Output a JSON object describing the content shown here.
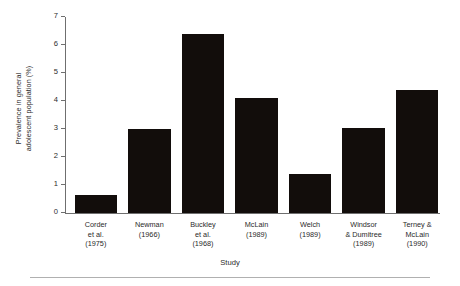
{
  "chart_data": {
    "type": "bar",
    "title": "",
    "xlabel": "Study",
    "ylabel": "Prevalence in general adolescent population (%)",
    "ylabel_lines": [
      "Prevalence in general",
      "adolescent population (%)"
    ],
    "categories": [
      "Corder et al. (1975)",
      "Newman (1966)",
      "Buckley et al. (1968)",
      "McLain (1989)",
      "Welch (1989)",
      "Windsor & Dumitree (1989)",
      "Terney & McLain (1990)"
    ],
    "category_lines": [
      [
        "Corder",
        "et al.",
        "(1975)"
      ],
      [
        "Newman",
        "(1966)"
      ],
      [
        "Buckley",
        "et al.",
        "(1968)"
      ],
      [
        "McLain",
        "(1989)"
      ],
      [
        "Welch",
        "(1989)"
      ],
      [
        "Windsor",
        "& Dumitree",
        "(1989)"
      ],
      [
        "Terney &",
        "McLain",
        "(1990)"
      ]
    ],
    "values": [
      0.65,
      3.0,
      6.4,
      4.1,
      1.4,
      3.05,
      4.4
    ],
    "ylim": [
      0,
      7
    ],
    "yticks": [
      0,
      1,
      2,
      3,
      4,
      5,
      6,
      7
    ],
    "ytick_labels": [
      "0",
      "1",
      "2",
      "3",
      "4",
      "5",
      "6",
      "7"
    ],
    "grid": false,
    "legend": null,
    "bar_color": "#120d0b",
    "axis_color": "#6f6f6f"
  }
}
